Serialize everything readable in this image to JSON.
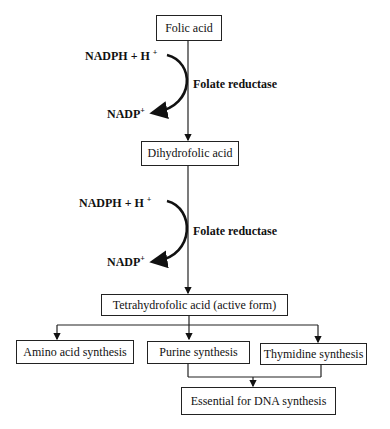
{
  "nodes": {
    "folic_acid": "Folic acid",
    "dihydrofolic_acid": "Dihydrofolic acid",
    "tetrahydrofolic_acid": "Tetrahydrofolic acid (active form)",
    "amino_acid_synthesis": "Amino acid synthesis",
    "purine_synthesis": "Purine synthesis",
    "thymidine_synthesis": "Thymidine synthesis",
    "dna_synthesis": "Essential for DNA synthesis"
  },
  "steps": [
    {
      "cofactor_in": "NADPH + H",
      "cofactor_in_sup": "+",
      "enzyme": "Folate reductase",
      "cofactor_out": "NADP",
      "cofactor_out_sup": "+"
    },
    {
      "cofactor_in": "NADPH + H",
      "cofactor_in_sup": "+",
      "enzyme": "Folate reductase",
      "cofactor_out": "NADP",
      "cofactor_out_sup": "+"
    }
  ]
}
